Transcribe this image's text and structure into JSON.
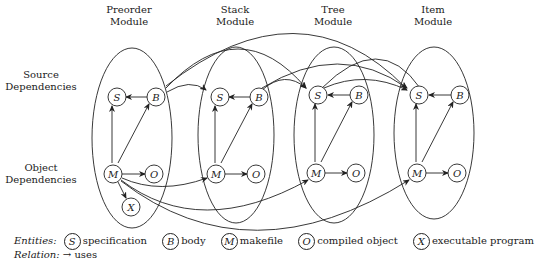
{
  "modules": [
    {
      "id": "preorder",
      "title_line1": "Preorder",
      "title_line2": "Module"
    },
    {
      "id": "stack",
      "title_line1": "Stack",
      "title_line2": "Module"
    },
    {
      "id": "tree",
      "title_line1": "Tree",
      "title_line2": "Module"
    },
    {
      "id": "item",
      "title_line1": "Item",
      "title_line2": "Module"
    }
  ],
  "rows": {
    "source": {
      "line1": "Source",
      "line2": "Dependencies"
    },
    "object": {
      "line1": "Object",
      "line2": "Dependencies"
    }
  },
  "nodes": {
    "S": "S",
    "B": "B",
    "M": "M",
    "O": "O",
    "X": "X"
  },
  "legend": {
    "entities_label": "Entities:",
    "entities": [
      {
        "symbol": "S",
        "label": "specification"
      },
      {
        "symbol": "B",
        "label": "body"
      },
      {
        "symbol": "M",
        "label": "makefile"
      },
      {
        "symbol": "O",
        "label": "compiled object"
      },
      {
        "symbol": "X",
        "label": "executable program"
      }
    ],
    "relation_label": "Relation:",
    "relation_arrow": "→",
    "relation_text": "uses"
  }
}
